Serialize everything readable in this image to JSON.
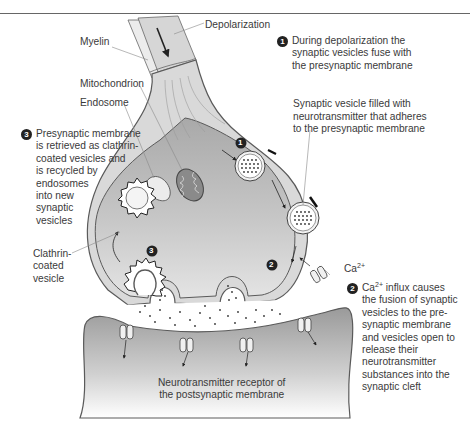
{
  "figure": {
    "labels": {
      "myelin": "Myelin",
      "depolarization": "Depolarization",
      "mitochondrion": "Mitochondrion",
      "endosome": "Endosome",
      "vesicle_label": "Synaptic vesicle filled with neurotransmitter that adheres to the presynaptic membrane",
      "vesicle_line1": "Synaptic vesicle filled with",
      "vesicle_line2": "neurotransmitter that adheres",
      "vesicle_line3": "to the presynaptic membrane",
      "clathrin_line1": "Clathrin-",
      "clathrin_line2": "coated",
      "clathrin_line3": "vesicle",
      "ca_ion": "Ca",
      "ca_charge": "2+",
      "receptor_line1": "Neurotransmitter receptor of",
      "receptor_line2": "the postsynaptic membrane"
    },
    "steps": [
      {
        "number": "1",
        "lines": [
          "During depolarization the",
          "synaptic vesicles fuse with",
          "the presynaptic membrane"
        ]
      },
      {
        "number": "2",
        "prefix": "Ca",
        "charge": "2+",
        "lines": [
          " influx causes",
          "the fusion of synaptic",
          "vesicles to the pre-",
          "synaptic membrane",
          "and vesicles open to",
          "release their",
          "neurotransmitter",
          "substances into the",
          "synaptic cleft"
        ]
      },
      {
        "number": "3",
        "lines": [
          "Presynaptic membrane",
          "is retrieved as clathrin-",
          "coated vesicles and",
          "is recycled by",
          "endosomes",
          "into new",
          "synaptic",
          "vesicles"
        ]
      }
    ],
    "markers": {
      "in_diagram_1": "1",
      "in_diagram_2": "2",
      "in_diagram_3": "3"
    },
    "colors": {
      "terminal_fill": "#c4c4c4",
      "axon_fill": "#d6d6d6",
      "membrane": "#5a5a5a",
      "cleft": "#ffffff",
      "text": "#3a3a3a"
    }
  }
}
